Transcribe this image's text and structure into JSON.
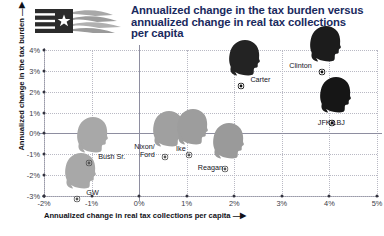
{
  "header": {
    "logo_name": "flag-wing-logo",
    "title_lines": [
      "Annualized change in the tax burden versus",
      "annualized change in real tax collections",
      "per capita"
    ]
  },
  "chart_data": {
    "type": "scatter",
    "title": "Annualized change in the tax burden versus annualized change in real tax collections per capita",
    "xlabel": "Annualized change in real tax collections per capita",
    "ylabel": "Annualized change in the tax burden",
    "xlim": [
      -2,
      5
    ],
    "ylim": [
      -3,
      4
    ],
    "xticks": [
      "-2%",
      "-1%",
      "0%",
      "1%",
      "2%",
      "3%",
      "4%",
      "5%"
    ],
    "xtick_values": [
      -2,
      -1,
      0,
      1,
      2,
      3,
      4,
      5
    ],
    "yticks": [
      "-3%",
      "-2%",
      "-1%",
      "0%",
      "1%",
      "2%",
      "3%",
      "4%"
    ],
    "ytick_values": [
      -3,
      -2,
      -1,
      0,
      1,
      2,
      3,
      4
    ],
    "grid": true,
    "legend": "none",
    "points": [
      {
        "label": "GW",
        "x": -1.3,
        "y": -2.8,
        "shade": "#a8a8a8",
        "label_dx": 9,
        "label_dy": -3
      },
      {
        "label": "Bush Sr.",
        "x": -1.05,
        "y": -1.1,
        "shade": "#a8a8a8",
        "label_dx": 9,
        "label_dy": -3
      },
      {
        "label": "Nixon/\nFord",
        "x": 0.55,
        "y": -0.8,
        "shade": "#a0a0a0",
        "label_dx": -31,
        "label_dy": -7
      },
      {
        "label": "Ike",
        "x": 1.05,
        "y": -0.7,
        "shade": "#9d9d9d",
        "label_dx": -13,
        "label_dy": -3
      },
      {
        "label": "Reagan",
        "x": 1.8,
        "y": -1.35,
        "shade": "#9a9a9a",
        "label_dx": -27,
        "label_dy": 2
      },
      {
        "label": "Carter",
        "x": 2.15,
        "y": 2.6,
        "shade": "#232323",
        "label_dx": 9,
        "label_dy": -3
      },
      {
        "label": "Clinton",
        "x": 3.85,
        "y": 3.3,
        "shade": "#1c1c1c",
        "label_dx": -33,
        "label_dy": -3
      },
      {
        "label": "JFK/LBJ",
        "x": 4.05,
        "y": 0.85,
        "shade": "#161616",
        "label_dx": -14,
        "label_dy": 3
      }
    ]
  },
  "colors": {
    "title": "#1a2a5e",
    "grid": "#b9b9c4",
    "axis": "#8e8ea0",
    "light_head": "#a8a8a8",
    "dark_head": "#1c1c1c"
  }
}
